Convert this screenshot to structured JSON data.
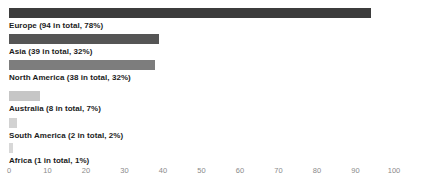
{
  "chart_data": {
    "type": "bar",
    "orientation": "horizontal",
    "title": "",
    "xlabel": "",
    "ylabel": "",
    "xlim": [
      0,
      100
    ],
    "xticks": [
      "0",
      "10",
      "20",
      "30",
      "40",
      "50",
      "60",
      "70",
      "80",
      "90",
      "100"
    ],
    "grid": false,
    "legend": "none",
    "categories": [
      "Europe",
      "Asia",
      "North America",
      "Australia",
      "South America",
      "Africa"
    ],
    "values": [
      94,
      39,
      38,
      8,
      2,
      1
    ],
    "percentages": [
      78,
      32,
      32,
      7,
      2,
      1
    ],
    "bars": [
      {
        "name": "Europe",
        "value": 94,
        "percent": 78,
        "label": "Europe (94 in total, 78%)",
        "color": "#3c3c3c"
      },
      {
        "name": "Asia",
        "value": 39,
        "percent": 32,
        "label": "Asia (39 in total, 32%)",
        "color": "#555555"
      },
      {
        "name": "North America",
        "value": 38,
        "percent": 32,
        "label": "North America (38 in total, 32%)",
        "color": "#7d7d7d"
      },
      {
        "name": "Australia",
        "value": 8,
        "percent": 7,
        "label": "Australia (8 in total, 7%)",
        "color": "#c6c6c6"
      },
      {
        "name": "South America",
        "value": 2,
        "percent": 2,
        "label": "South America (2 in total, 2%)",
        "color": "#d2d2d2"
      },
      {
        "name": "Africa",
        "value": 1,
        "percent": 1,
        "label": "Africa (1 in total, 1%)",
        "color": "#d8d8d8"
      }
    ]
  }
}
